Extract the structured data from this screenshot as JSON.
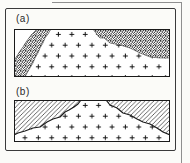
{
  "figure": {
    "panels": [
      {
        "label": "(a)",
        "patterns": [
          "plus-granite-field",
          "stipple-band-left",
          "stipple-band-right"
        ]
      },
      {
        "label": "(b)",
        "patterns": [
          "plus-granite-dome",
          "diagonal-hatch-left",
          "diagonal-hatch-right"
        ]
      }
    ],
    "colors": {
      "background": "#fbfbf8",
      "ink": "#1a1a1a",
      "frame": "#3a3a3a",
      "crop_line": "#8f8f8f"
    }
  }
}
